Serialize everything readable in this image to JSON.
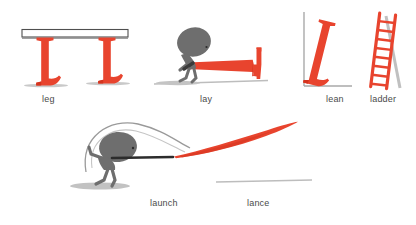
{
  "illustration": {
    "title": "Letter L word illustrations",
    "background_color": "#ffffff",
    "letter_color": "#e8442e",
    "letter_color_dark": "#d4341f",
    "figure_color": "#6e6e6e",
    "outline_color": "#555555",
    "shadow_color": "#b8b8b8",
    "caption_color": "#4a4a4a"
  },
  "panels": [
    {
      "id": "leg",
      "caption": "leg",
      "description": "two red serif L letters acting as table legs under a white tabletop",
      "letter_count": 2,
      "icon": "table-legs-icon"
    },
    {
      "id": "lay",
      "caption": "lay",
      "description": "gray figure pushing a red serif L lying on its back along the ground",
      "letter_count": 1,
      "icon": "laying-letter-icon"
    },
    {
      "id": "lean",
      "caption": "lean",
      "description": "red serif L tilted leaning against a corner wall",
      "letter_count": 1,
      "icon": "leaning-letter-icon"
    },
    {
      "id": "ladder",
      "caption": "ladder",
      "description": "red ladder with eight rungs leaning against a wall",
      "rungs": 8,
      "icon": "ladder-icon"
    },
    {
      "id": "launch",
      "caption": "launch",
      "description": "gray figure throwing, with swing arc motion line above the head",
      "icon": "throwing-figure-icon"
    },
    {
      "id": "lance",
      "caption": "lance",
      "description": "thin red streak flying through the air like a thrown lance",
      "icon": "flying-lance-icon"
    }
  ]
}
